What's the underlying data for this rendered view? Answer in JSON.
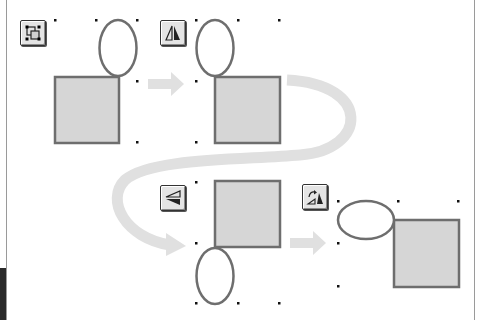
{
  "diagram": {
    "colors": {
      "shape_fill": "#d6d6d6",
      "shape_stroke": "#6e6e6e",
      "arrow_fill": "#e0e0e0",
      "handle": "#111111",
      "button_face": "#e4e4e4"
    },
    "steps": [
      {
        "id": "group",
        "tool_icon": "group-selection-icon",
        "order": 1
      },
      {
        "id": "flip-horizontal",
        "tool_icon": "flip-horizontal-icon",
        "order": 2
      },
      {
        "id": "flip-vertical",
        "tool_icon": "flip-vertical-icon",
        "order": 3
      },
      {
        "id": "rotate",
        "tool_icon": "rotate-icon",
        "order": 4
      }
    ],
    "arrows": [
      {
        "from": 1,
        "to": 2,
        "style": "straight"
      },
      {
        "from": 2,
        "to": 3,
        "style": "curved-loop"
      },
      {
        "from": 3,
        "to": 4,
        "style": "straight"
      }
    ]
  }
}
